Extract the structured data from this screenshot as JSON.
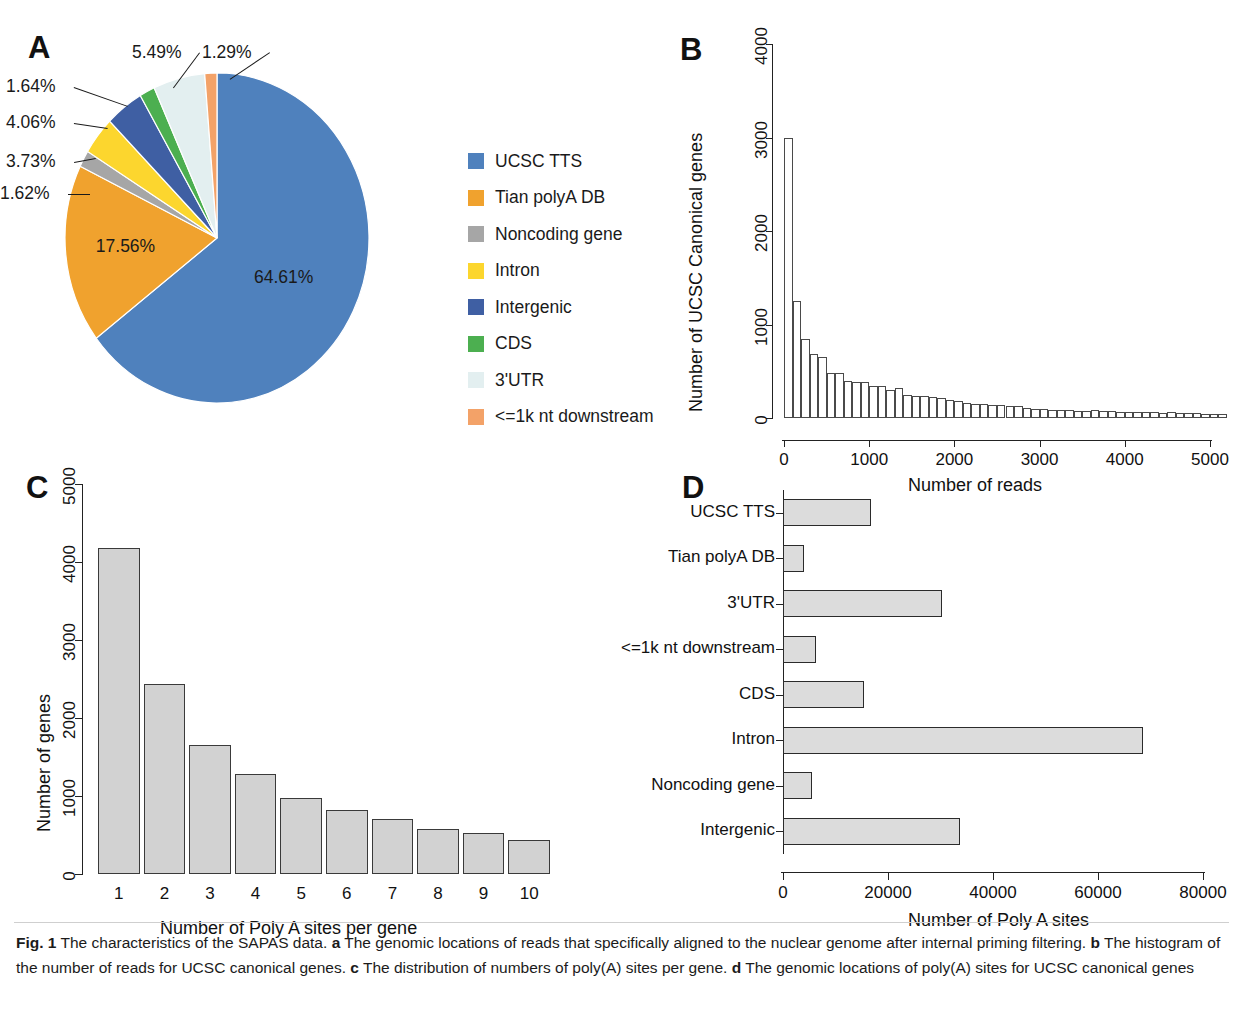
{
  "figure": {
    "panel_a_letter": "A",
    "panel_b_letter": "B",
    "panel_c_letter": "C",
    "panel_d_letter": "D",
    "caption_label": "Fig. 1",
    "caption_lead": "The characteristics of the SAPAS data.",
    "caption_a_tag": "a",
    "caption_a": "The genomic locations of reads that specifically aligned to the nuclear genome after internal priming filtering.",
    "caption_b_tag": "b",
    "caption_b": "The histogram of the number of reads for UCSC canonical genes.",
    "caption_c_tag": "c",
    "caption_c": "The distribution of numbers of poly(A) sites per gene.",
    "caption_d_tag": "d",
    "caption_d": "The genomic locations of poly(A) sites for UCSC canonical genes"
  },
  "chart_data": [
    {
      "panel": "A",
      "type": "pie",
      "title": "",
      "legend_position": "right",
      "labels": [
        "UCSC TTS",
        "Tian polyA DB",
        "Noncoding gene",
        "Intron",
        "Intergenic",
        "CDS",
        "3'UTR",
        "<=1k nt downstream"
      ],
      "values": [
        64.61,
        17.56,
        1.62,
        3.73,
        4.06,
        1.64,
        5.49,
        1.29
      ],
      "value_labels": [
        "64.61%",
        "17.56%",
        "1.62%",
        "3.73%",
        "4.06%",
        "1.64%",
        "5.49%",
        "1.29%"
      ],
      "colors": [
        "#4f81bd",
        "#f0a22e",
        "#a6a6a6",
        "#fcd62e",
        "#3f5fa3",
        "#4caf50",
        "#e3eff0",
        "#f3a268"
      ]
    },
    {
      "panel": "B",
      "type": "bar",
      "title": "",
      "xlabel": "Number of reads",
      "ylabel": "Number of UCSC Canonical genes",
      "xlim": [
        0,
        5200
      ],
      "ylim": [
        0,
        4000
      ],
      "xticks": [
        0,
        1000,
        2000,
        3000,
        4000,
        5000
      ],
      "xtick_labels": [
        "0",
        "1000",
        "2000",
        "3000",
        "4000",
        "5000"
      ],
      "yticks": [
        0,
        1000,
        2000,
        3000,
        4000
      ],
      "ytick_labels": [
        "0",
        "1000",
        "2000",
        "3000",
        "4000"
      ],
      "grid": false,
      "bin_width": 100,
      "bin_starts": [
        0,
        100,
        200,
        300,
        400,
        500,
        600,
        700,
        800,
        900,
        1000,
        1100,
        1200,
        1300,
        1400,
        1500,
        1600,
        1700,
        1800,
        1900,
        2000,
        2100,
        2200,
        2300,
        2400,
        2500,
        2600,
        2700,
        2800,
        2900,
        3000,
        3100,
        3200,
        3300,
        3400,
        3500,
        3600,
        3700,
        3800,
        3900,
        4000,
        4100,
        4200,
        4300,
        4400,
        4500,
        4600,
        4700,
        4800,
        4900,
        5000,
        5100
      ],
      "values": [
        2990,
        1250,
        840,
        680,
        650,
        480,
        480,
        400,
        390,
        380,
        340,
        340,
        300,
        320,
        250,
        240,
        230,
        220,
        210,
        190,
        180,
        165,
        155,
        150,
        140,
        135,
        125,
        130,
        105,
        100,
        95,
        90,
        90,
        85,
        80,
        78,
        85,
        72,
        70,
        68,
        66,
        64,
        62,
        60,
        58,
        62,
        55,
        52,
        50,
        48,
        45,
        42
      ]
    },
    {
      "panel": "C",
      "type": "bar",
      "title": "",
      "xlabel": "Number of Poly A sites per gene",
      "ylabel": "Number of genes",
      "categories": [
        "1",
        "2",
        "3",
        "4",
        "5",
        "6",
        "7",
        "8",
        "9",
        "10"
      ],
      "values": [
        4180,
        2440,
        1660,
        1280,
        970,
        820,
        710,
        580,
        520,
        440
      ],
      "ylim": [
        0,
        5000
      ],
      "yticks": [
        0,
        1000,
        2000,
        3000,
        4000,
        5000
      ],
      "ytick_labels": [
        "0",
        "1000",
        "2000",
        "3000",
        "4000",
        "5000"
      ],
      "grid": false,
      "bar_color": "#d2d2d2"
    },
    {
      "panel": "D",
      "type": "bar",
      "orientation": "horizontal",
      "title": "",
      "xlabel": "Number of Poly A sites",
      "ylabel": "",
      "categories": [
        "UCSC TTS",
        "Tian polyA DB",
        "3'UTR",
        "<=1k nt downstream",
        "CDS",
        "Intron",
        "Noncoding gene",
        "Intergenic"
      ],
      "values": [
        16800,
        4000,
        30300,
        6300,
        15400,
        68500,
        5500,
        33700
      ],
      "xlim": [
        0,
        80000
      ],
      "xticks": [
        0,
        20000,
        40000,
        60000,
        80000
      ],
      "xtick_labels": [
        "0",
        "20000",
        "40000",
        "60000",
        "80000"
      ],
      "grid": false,
      "bar_color": "#dcdcdc"
    }
  ]
}
